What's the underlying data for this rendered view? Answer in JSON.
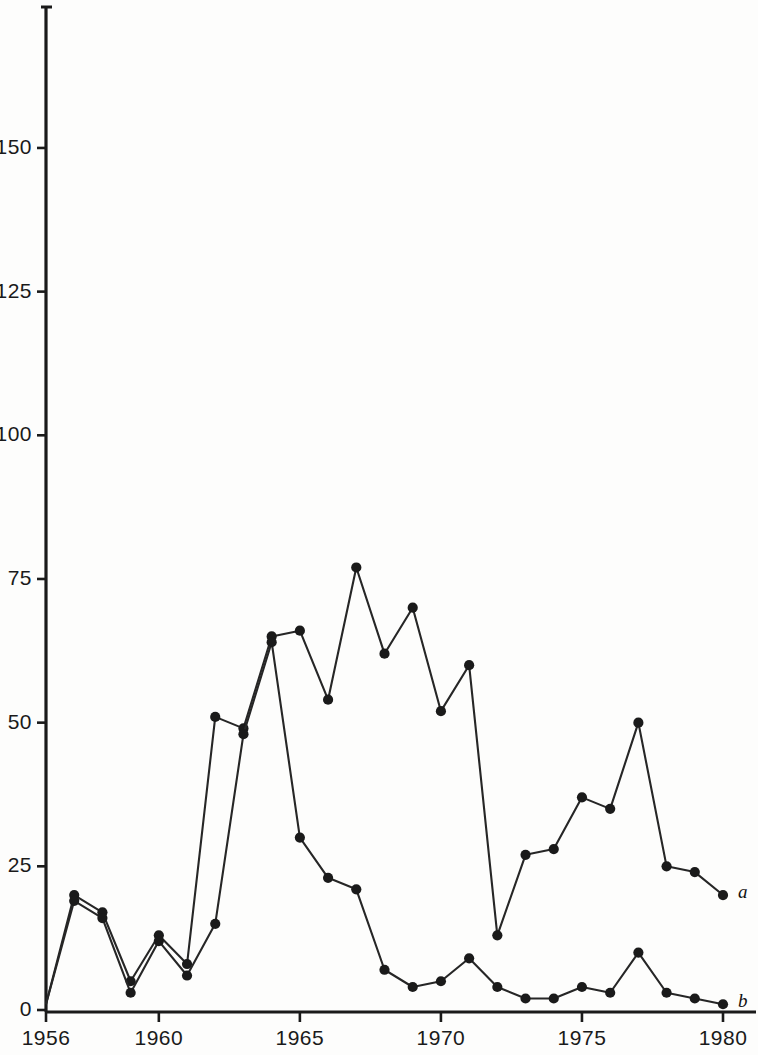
{
  "chart_data": {
    "type": "line",
    "title": "",
    "subtitle": "",
    "xlabel": "",
    "ylabel": "",
    "xlim": [
      1956,
      1980
    ],
    "ylim": [
      0,
      170
    ],
    "grid": false,
    "legend_position": "right-end-of-line",
    "x": [
      1956,
      1957,
      1958,
      1959,
      1960,
      1961,
      1962,
      1963,
      1964,
      1965,
      1966,
      1967,
      1968,
      1969,
      1970,
      1971,
      1972,
      1973,
      1974,
      1975,
      1976,
      1977,
      1978,
      1979,
      1980
    ],
    "xticks": [
      1956,
      1960,
      1965,
      1970,
      1975,
      1980
    ],
    "xtick_labels": [
      "1956",
      "1960",
      "1965",
      "1970",
      "1975",
      "1980"
    ],
    "yticks": [
      0,
      25,
      50,
      75,
      100,
      125,
      150
    ],
    "ytick_labels": [
      "0",
      "25",
      "50",
      "75",
      "100",
      "125",
      "150"
    ],
    "series": [
      {
        "name": "a",
        "label": "a",
        "marker": "filled-circle",
        "values": [
          1,
          20,
          17,
          5,
          13,
          8,
          51,
          49,
          65,
          66,
          54,
          77,
          62,
          70,
          52,
          60,
          13,
          27,
          28,
          37,
          35,
          50,
          25,
          24,
          20
        ]
      },
      {
        "name": "b",
        "label": "b",
        "marker": "filled-circle",
        "values": [
          1,
          19,
          16,
          3,
          12,
          6,
          15,
          48,
          64,
          30,
          23,
          21,
          7,
          4,
          5,
          9,
          4,
          2,
          2,
          4,
          3,
          10,
          3,
          2,
          1
        ]
      }
    ],
    "colors": {
      "line": "#262626",
      "marker": "#1a1a1a",
      "axis": "#1a1a1a",
      "background": "#fdfdfc",
      "text": "#1a1a1a"
    }
  },
  "axes": {
    "y_axis_name": "y-axis",
    "x_axis_name": "x-axis"
  }
}
